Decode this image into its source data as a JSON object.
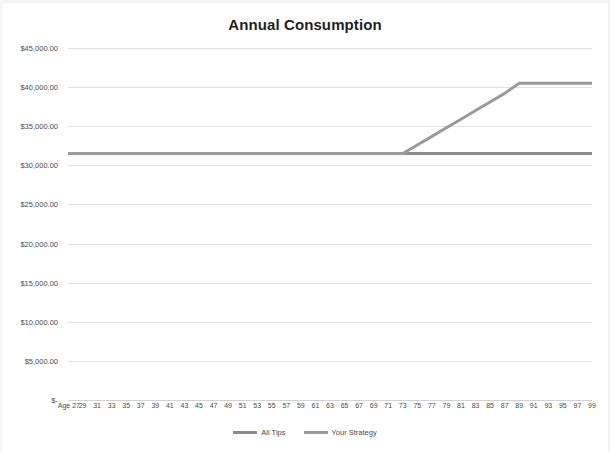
{
  "chart_data": {
    "type": "line",
    "title": "Annual Consumption",
    "xlabel": "",
    "ylabel": "",
    "grid": true,
    "legend_position": "bottom-center",
    "ylim": [
      0,
      45000
    ],
    "y_ticks": [
      45000,
      40000,
      35000,
      30000,
      25000,
      20000,
      15000,
      10000,
      5000,
      0
    ],
    "y_tick_labels": [
      "$45,000.00",
      "$40,000.00",
      "$35,000.00",
      "$30,000.00",
      "$25,000.00",
      "$20,000.00",
      "$15,000.00",
      "$10,000.00",
      "$5,000.00",
      "$-"
    ],
    "x": [
      27,
      29,
      31,
      33,
      35,
      37,
      39,
      41,
      43,
      45,
      47,
      49,
      51,
      53,
      55,
      57,
      59,
      61,
      63,
      65,
      67,
      69,
      71,
      73,
      75,
      77,
      79,
      81,
      83,
      85,
      87,
      89,
      91,
      93,
      95,
      97,
      99
    ],
    "x_tick_labels": [
      "Age 27",
      "29",
      "31",
      "33",
      "35",
      "37",
      "39",
      "41",
      "43",
      "45",
      "47",
      "49",
      "51",
      "53",
      "55",
      "57",
      "59",
      "61",
      "63",
      "65",
      "67",
      "69",
      "71",
      "73",
      "75",
      "77",
      "79",
      "81",
      "83",
      "85",
      "87",
      "89",
      "91",
      "93",
      "95",
      "97",
      "99"
    ],
    "series": [
      {
        "name": "All Tips",
        "color": "#8c8c8c",
        "values": [
          31500,
          31500,
          31500,
          31500,
          31500,
          31500,
          31500,
          31500,
          31500,
          31500,
          31500,
          31500,
          31500,
          31500,
          31500,
          31500,
          31500,
          31500,
          31500,
          31500,
          31500,
          31500,
          31500,
          31500,
          31500,
          31500,
          31500,
          31500,
          31500,
          31500,
          31500,
          31500,
          31500,
          31500,
          31500,
          31500,
          31500
        ]
      },
      {
        "name": "Your Strategy",
        "color": "#9a9a9a",
        "values": [
          31500,
          31500,
          31500,
          31500,
          31500,
          31500,
          31500,
          31500,
          31500,
          31500,
          31500,
          31500,
          31500,
          31500,
          31500,
          31500,
          31500,
          31500,
          31500,
          31500,
          31500,
          31500,
          31500,
          31500,
          32600,
          33700,
          34800,
          35900,
          37000,
          38100,
          39200,
          40500,
          40500,
          40500,
          40500,
          40500,
          40500
        ]
      }
    ]
  }
}
